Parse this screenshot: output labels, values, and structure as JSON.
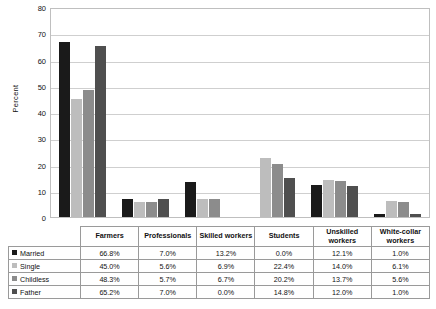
{
  "chart_data": {
    "type": "bar",
    "title": "",
    "xlabel": "",
    "ylabel": "Percent",
    "ylim": [
      0,
      80
    ],
    "ytick_step": 10,
    "yticks": [
      80,
      70,
      60,
      50,
      40,
      30,
      20,
      10,
      0
    ],
    "grid": true,
    "legend_position": "table-below",
    "categories": [
      "Farmers",
      "Professionals",
      "Skilled workers",
      "Students",
      "Unskilled workers",
      "White-collar workers"
    ],
    "series": [
      {
        "name": "Married",
        "color": "#1a1a1a",
        "values": [
          66.8,
          7.0,
          13.2,
          0.0,
          12.1,
          1.0
        ],
        "labels": [
          "66.8%",
          "7.0%",
          "13.2%",
          "0.0%",
          "12.1%",
          "1.0%"
        ]
      },
      {
        "name": "Single",
        "color": "#bdbdbd",
        "values": [
          45.0,
          5.6,
          6.9,
          22.4,
          14.0,
          6.1
        ],
        "labels": [
          "45.0%",
          "5.6%",
          "6.9%",
          "22.4%",
          "14.0%",
          "6.1%"
        ]
      },
      {
        "name": "Childless",
        "color": "#8c8c8c",
        "values": [
          48.3,
          5.7,
          6.7,
          20.2,
          13.7,
          5.6
        ],
        "labels": [
          "48.3%",
          "5.7%",
          "6.7%",
          "20.2%",
          "13.7%",
          "5.6%"
        ]
      },
      {
        "name": "Father",
        "color": "#4f4f4f",
        "values": [
          65.2,
          7.0,
          0.0,
          14.8,
          12.0,
          1.0
        ],
        "labels": [
          "65.2%",
          "7.0%",
          "0.0%",
          "14.8%",
          "12.0%",
          "1.0%"
        ]
      }
    ]
  },
  "colors": {
    "married": "#1a1a1a",
    "single": "#bdbdbd",
    "childless": "#8c8c8c",
    "father": "#4f4f4f",
    "gridline": "#cfcfcf",
    "plot_border": "#bfbfbf",
    "table_border": "#9a9a9a",
    "background": "#ffffff"
  }
}
